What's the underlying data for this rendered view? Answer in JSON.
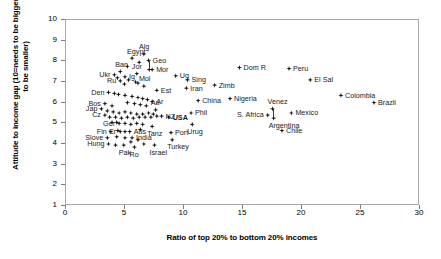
{
  "chart_data": {
    "type": "scatter",
    "title": "",
    "xlabel": "Ratio of top 20% to bottom 20% incomes",
    "ylabel": "Attitude to income gap (10=needs to be bigger, 1=needs to be smaller)",
    "xlim": [
      0,
      30
    ],
    "ylim": [
      1,
      10
    ],
    "xticks": [
      "0",
      "5",
      "10",
      "15",
      "20",
      "25",
      "30"
    ],
    "yticks": [
      "1",
      "2",
      "3",
      "4",
      "5",
      "6",
      "7",
      "8",
      "9",
      "10"
    ],
    "grid": false,
    "legend": "none",
    "marker_color": "#111111",
    "frame_color": "#a8a8a8",
    "points": [
      {
        "label": "Egypt",
        "x": 5.6,
        "y": 8.15,
        "pos": "t"
      },
      {
        "label": "Alg",
        "x": 6.6,
        "y": 8.35,
        "pos": "t"
      },
      {
        "label": "Geo",
        "x": 7.0,
        "y": 8.05,
        "pos": "r"
      },
      {
        "label": "Mor",
        "x": 7.3,
        "y": 7.6,
        "pos": "r"
      },
      {
        "label": "Ban",
        "x": 4.6,
        "y": 7.5,
        "pos": "t"
      },
      {
        "label": "Ukr",
        "x": 4.1,
        "y": 7.35,
        "pos": "l"
      },
      {
        "label": "Ig",
        "x": 5.0,
        "y": 7.25,
        "pos": "r"
      },
      {
        "label": "Jor",
        "x": 6.0,
        "y": 7.4,
        "pos": "t"
      },
      {
        "label": "Ru",
        "x": 4.6,
        "y": 7.05,
        "pos": "l"
      },
      {
        "label": "Ug",
        "x": 9.3,
        "y": 7.3,
        "pos": "r"
      },
      {
        "label": "Sing",
        "x": 10.3,
        "y": 7.1,
        "pos": "r"
      },
      {
        "label": "Dom R",
        "x": 14.7,
        "y": 7.7,
        "pos": "r"
      },
      {
        "label": "Peru",
        "x": 18.9,
        "y": 7.65,
        "pos": "r"
      },
      {
        "label": "El Sal",
        "x": 20.7,
        "y": 7.1,
        "pos": "r"
      },
      {
        "label": "Mol",
        "x": 6.6,
        "y": 6.8,
        "pos": "t"
      },
      {
        "label": "Est",
        "x": 7.7,
        "y": 6.6,
        "pos": "r"
      },
      {
        "label": "Den",
        "x": 3.6,
        "y": 6.5,
        "pos": "l"
      },
      {
        "label": "Iran",
        "x": 10.2,
        "y": 6.7,
        "pos": "r"
      },
      {
        "label": "Zimb",
        "x": 12.6,
        "y": 6.85,
        "pos": "r"
      },
      {
        "label": "Nigeria",
        "x": 13.9,
        "y": 6.2,
        "pos": "r"
      },
      {
        "label": "China",
        "x": 11.2,
        "y": 6.1,
        "pos": "r"
      },
      {
        "label": "Colombia",
        "x": 23.3,
        "y": 6.35,
        "pos": "r"
      },
      {
        "label": "Brazil",
        "x": 26.1,
        "y": 6.0,
        "pos": "r"
      },
      {
        "label": "Venez",
        "x": 17.5,
        "y": 5.7,
        "pos": "t"
      },
      {
        "label": "S. Africa",
        "x": 17.1,
        "y": 5.4,
        "pos": "l"
      },
      {
        "label": "Mexico",
        "x": 19.1,
        "y": 5.5,
        "pos": "r"
      },
      {
        "label": "Argentina",
        "x": 17.6,
        "y": 5.25,
        "pos": "b"
      },
      {
        "label": "Chile",
        "x": 18.3,
        "y": 4.65,
        "pos": "r"
      },
      {
        "label": "Ar",
        "x": 7.3,
        "y": 6.05,
        "pos": "r"
      },
      {
        "label": "Bos",
        "x": 3.3,
        "y": 5.95,
        "pos": "l"
      },
      {
        "label": "Jap",
        "x": 3.0,
        "y": 5.7,
        "pos": "l"
      },
      {
        "label": "Au",
        "x": 7.6,
        "y": 5.65,
        "pos": "t"
      },
      {
        "label": "Phil",
        "x": 10.6,
        "y": 5.5,
        "pos": "r"
      },
      {
        "label": "Cz",
        "x": 3.3,
        "y": 5.4,
        "pos": "l"
      },
      {
        "label": "NZ",
        "x": 8.1,
        "y": 5.35,
        "pos": "r"
      },
      {
        "label": "USA",
        "x": 8.7,
        "y": 5.3,
        "pos": "r",
        "bold": true
      },
      {
        "label": "Urug",
        "x": 10.7,
        "y": 4.95,
        "pos": "b"
      },
      {
        "label": "Ger",
        "x": 4.5,
        "y": 5.0,
        "pos": "l"
      },
      {
        "label": "Tanz",
        "x": 7.3,
        "y": 4.85,
        "pos": "b"
      },
      {
        "label": "Fin",
        "x": 3.8,
        "y": 4.6,
        "pos": "l"
      },
      {
        "label": "Cr",
        "x": 4.6,
        "y": 4.6,
        "pos": "l"
      },
      {
        "label": "Aus",
        "x": 5.4,
        "y": 4.6,
        "pos": "r"
      },
      {
        "label": "Port",
        "x": 8.9,
        "y": 4.55,
        "pos": "r"
      },
      {
        "label": "Slove",
        "x": 3.5,
        "y": 4.3,
        "pos": "l"
      },
      {
        "label": "India",
        "x": 5.6,
        "y": 4.3,
        "pos": "r"
      },
      {
        "label": "Turkey",
        "x": 9.0,
        "y": 4.2,
        "pos": "b"
      },
      {
        "label": "Hung",
        "x": 3.6,
        "y": 4.0,
        "pos": "l"
      },
      {
        "label": "Pak",
        "x": 4.9,
        "y": 3.95,
        "pos": "b"
      },
      {
        "label": "Ro",
        "x": 5.8,
        "y": 3.85,
        "pos": "b"
      },
      {
        "label": "Israel",
        "x": 7.5,
        "y": 3.95,
        "pos": "b"
      }
    ],
    "unlabeled_points": [
      {
        "x": 5.2,
        "y": 7.75
      },
      {
        "x": 6.2,
        "y": 7.95
      },
      {
        "x": 7.05,
        "y": 7.6
      },
      {
        "x": 4.35,
        "y": 7.2
      },
      {
        "x": 5.3,
        "y": 7.1
      },
      {
        "x": 5.9,
        "y": 7.0
      },
      {
        "x": 4.95,
        "y": 6.9
      },
      {
        "x": 6.1,
        "y": 6.95
      },
      {
        "x": 4.1,
        "y": 6.45
      },
      {
        "x": 4.45,
        "y": 6.4
      },
      {
        "x": 5.0,
        "y": 6.35
      },
      {
        "x": 5.6,
        "y": 6.3
      },
      {
        "x": 6.1,
        "y": 6.25
      },
      {
        "x": 6.5,
        "y": 6.2
      },
      {
        "x": 6.9,
        "y": 6.15
      },
      {
        "x": 5.2,
        "y": 6.0
      },
      {
        "x": 5.8,
        "y": 5.95
      },
      {
        "x": 6.3,
        "y": 5.9
      },
      {
        "x": 6.8,
        "y": 5.85
      },
      {
        "x": 3.9,
        "y": 5.85
      },
      {
        "x": 3.5,
        "y": 5.6
      },
      {
        "x": 4.0,
        "y": 5.55
      },
      {
        "x": 4.5,
        "y": 5.5
      },
      {
        "x": 5.0,
        "y": 5.55
      },
      {
        "x": 5.5,
        "y": 5.5
      },
      {
        "x": 6.0,
        "y": 5.45
      },
      {
        "x": 6.5,
        "y": 5.45
      },
      {
        "x": 7.0,
        "y": 5.5
      },
      {
        "x": 7.4,
        "y": 5.45
      },
      {
        "x": 3.7,
        "y": 5.3
      },
      {
        "x": 4.2,
        "y": 5.3
      },
      {
        "x": 4.7,
        "y": 5.25
      },
      {
        "x": 5.2,
        "y": 5.3
      },
      {
        "x": 5.7,
        "y": 5.25
      },
      {
        "x": 6.2,
        "y": 5.3
      },
      {
        "x": 6.7,
        "y": 5.3
      },
      {
        "x": 7.2,
        "y": 5.3
      },
      {
        "x": 7.7,
        "y": 5.35
      },
      {
        "x": 3.9,
        "y": 5.05
      },
      {
        "x": 4.3,
        "y": 5.05
      },
      {
        "x": 5.0,
        "y": 5.0
      },
      {
        "x": 5.5,
        "y": 4.95
      },
      {
        "x": 6.0,
        "y": 5.0
      },
      {
        "x": 6.5,
        "y": 4.95
      },
      {
        "x": 4.4,
        "y": 4.65
      },
      {
        "x": 5.0,
        "y": 4.6
      },
      {
        "x": 6.3,
        "y": 4.7
      },
      {
        "x": 4.3,
        "y": 4.35
      },
      {
        "x": 5.0,
        "y": 4.3
      },
      {
        "x": 5.5,
        "y": 4.1
      },
      {
        "x": 6.1,
        "y": 4.2
      },
      {
        "x": 4.2,
        "y": 3.95
      },
      {
        "x": 6.6,
        "y": 4.0
      }
    ]
  }
}
